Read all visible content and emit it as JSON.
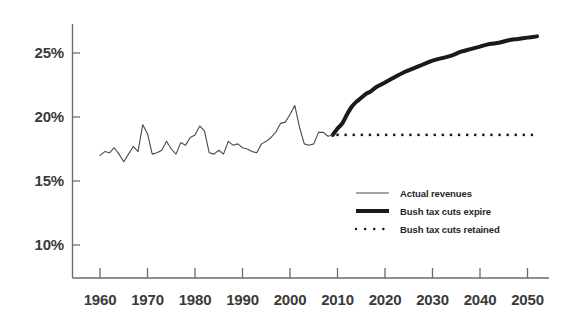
{
  "chart_data": {
    "type": "line",
    "title": "",
    "subtitle": "",
    "xlabel": "",
    "ylabel": "",
    "xlim": [
      1957,
      2053
    ],
    "ylim": [
      8.0,
      27.5
    ],
    "grid": false,
    "y_ticks": [
      10,
      15,
      20,
      25
    ],
    "y_tick_labels": [
      "10%",
      "15%",
      "20%",
      "25%"
    ],
    "x_ticks": [
      1960,
      1970,
      1980,
      1990,
      2000,
      2010,
      2020,
      2030,
      2040,
      2050
    ],
    "x_tick_labels": [
      "1960",
      "1970",
      "1980",
      "1990",
      "2000",
      "2010",
      "2020",
      "2030",
      "2040",
      "2050"
    ],
    "legend_position": "center-right-inside",
    "series": [
      {
        "name": "Actual revenues",
        "style": "thin-solid",
        "color": "#4a4a4a",
        "linewidth": 1,
        "x": [
          1960,
          1961,
          1962,
          1963,
          1964,
          1965,
          1966,
          1967,
          1968,
          1969,
          1970,
          1971,
          1972,
          1973,
          1974,
          1975,
          1976,
          1977,
          1978,
          1979,
          1980,
          1981,
          1982,
          1983,
          1984,
          1985,
          1986,
          1987,
          1988,
          1989,
          1990,
          1991,
          1992,
          1993,
          1994,
          1995,
          1996,
          1997,
          1998,
          1999,
          2000,
          2001,
          2002,
          2003,
          2004,
          2005,
          2006,
          2007,
          2008,
          2009
        ],
        "values": [
          17.0,
          17.3,
          17.2,
          17.6,
          17.1,
          16.5,
          17.1,
          17.7,
          17.3,
          19.4,
          18.7,
          17.1,
          17.2,
          17.4,
          18.1,
          17.5,
          17.1,
          18.0,
          17.8,
          18.4,
          18.6,
          19.3,
          18.9,
          17.2,
          17.1,
          17.4,
          17.1,
          18.1,
          17.8,
          17.9,
          17.6,
          17.5,
          17.3,
          17.2,
          17.9,
          18.1,
          18.4,
          18.8,
          19.5,
          19.6,
          20.2,
          20.9,
          19.2,
          17.9,
          17.8,
          17.9,
          18.8,
          18.8,
          18.5,
          18.6
        ]
      },
      {
        "name": "Bush tax cuts expire",
        "style": "thick-solid",
        "color": "#1a1a1a",
        "linewidth": 4,
        "x": [
          2009,
          2010,
          2011,
          2012,
          2013,
          2014,
          2015,
          2016,
          2017,
          2018,
          2019,
          2020,
          2022,
          2024,
          2026,
          2028,
          2030,
          2032,
          2034,
          2036,
          2038,
          2040,
          2042,
          2044,
          2046,
          2048,
          2050,
          2052
        ],
        "values": [
          18.6,
          19.1,
          19.5,
          20.2,
          20.8,
          21.2,
          21.5,
          21.8,
          22.0,
          22.3,
          22.5,
          22.7,
          23.1,
          23.5,
          23.8,
          24.1,
          24.4,
          24.6,
          24.8,
          25.1,
          25.3,
          25.5,
          25.7,
          25.8,
          26.0,
          26.1,
          26.2,
          26.3
        ]
      },
      {
        "name": "Bush tax cuts retained",
        "style": "dotted",
        "color": "#1a1a1a",
        "linewidth": 2.5,
        "x": [
          2010,
          2052
        ],
        "values": [
          18.6,
          18.6
        ]
      }
    ],
    "legend": [
      {
        "label": "Actual revenues",
        "style": "thin-solid"
      },
      {
        "label": "Bush tax cuts expire",
        "style": "thick-solid"
      },
      {
        "label": "Bush tax cuts retained",
        "style": "dotted"
      }
    ],
    "colors": {
      "axis": "#6b6b6b",
      "tick_label": "#3a3a3a",
      "actual_line": "#4a4a4a",
      "projection_line": "#1a1a1a",
      "background": "#ffffff"
    }
  }
}
